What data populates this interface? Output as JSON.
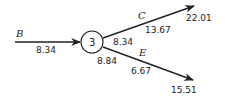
{
  "diagram": {
    "node": {
      "label": "3",
      "value_in": "8.34",
      "value_out_c": "8.34",
      "value_out_e": "8.84"
    },
    "edges": {
      "B": {
        "label": "B",
        "value": "8.34"
      },
      "C": {
        "label": "C",
        "value": "13.67",
        "end_value": "22.01"
      },
      "E": {
        "label": "E",
        "value": "6.67",
        "end_value": "15.51"
      }
    }
  }
}
